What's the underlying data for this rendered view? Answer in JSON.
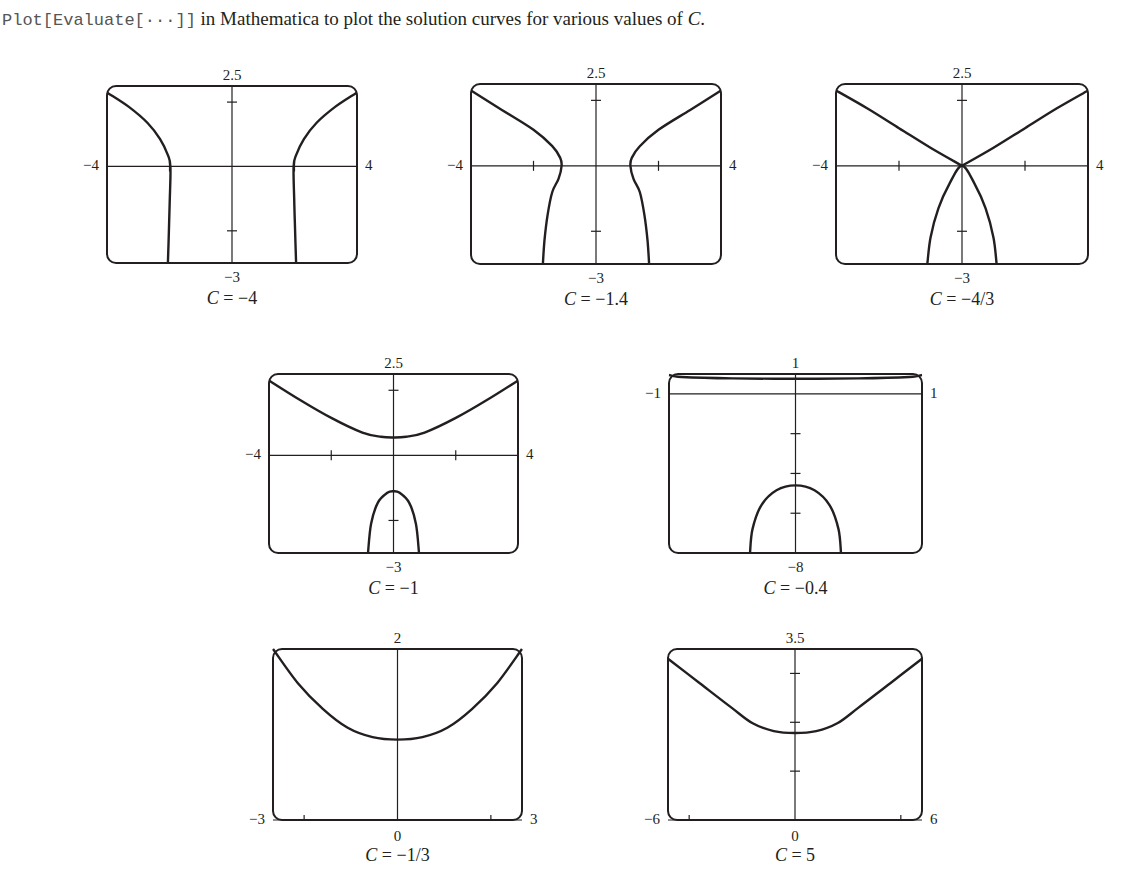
{
  "intro": {
    "code": "Plot[Evaluate[···]]",
    "text_before_c": " in Mathematica to plot the solution curves for various values of ",
    "c_symbol": "C",
    "text_after_c": "."
  },
  "chart_data": [
    {
      "type": "line",
      "title": "C = −4",
      "caption_var": "C",
      "caption_value": "= −4",
      "frame": {
        "left": 107,
        "top": 86,
        "width": 250,
        "height": 177
      },
      "xlim": [
        -4,
        4
      ],
      "ylim": [
        -3,
        2.5
      ],
      "axis_y_at": 0,
      "labels": {
        "top": "2.5",
        "bottom": "−3",
        "left": "−4",
        "right": "4"
      },
      "xticks": [
        -2,
        2
      ],
      "yticks": [
        -2,
        2
      ],
      "grid": false,
      "series": [
        {
          "name": "left-branch",
          "points": [
            [
              -4,
              2.3
            ],
            [
              -3.3,
              1.85
            ],
            [
              -2.7,
              1.35
            ],
            [
              -2.3,
              0.85
            ],
            [
              -2.05,
              0.35
            ],
            [
              -1.97,
              0
            ],
            [
              -1.99,
              -1
            ],
            [
              -2.02,
              -2
            ],
            [
              -2.05,
              -3
            ]
          ]
        },
        {
          "name": "right-branch",
          "points": [
            [
              4,
              2.3
            ],
            [
              3.3,
              1.85
            ],
            [
              2.7,
              1.35
            ],
            [
              2.3,
              0.85
            ],
            [
              2.05,
              0.35
            ],
            [
              1.97,
              0
            ],
            [
              1.99,
              -1
            ],
            [
              2.02,
              -2
            ],
            [
              2.05,
              -3
            ]
          ]
        }
      ]
    },
    {
      "type": "line",
      "title": "C = −1.4",
      "caption_var": "C",
      "caption_value": "= −1.4",
      "frame": {
        "left": 471,
        "top": 84,
        "width": 250,
        "height": 180
      },
      "xlim": [
        -4,
        4
      ],
      "ylim": [
        -3,
        2.5
      ],
      "axis_y_at": 0,
      "labels": {
        "top": "2.5",
        "bottom": "−3",
        "left": "−4",
        "right": "4"
      },
      "xticks": [
        -2,
        2
      ],
      "yticks": [
        -2,
        2
      ],
      "grid": false,
      "series": [
        {
          "name": "left-branch",
          "points": [
            [
              -4,
              2.3
            ],
            [
              -3,
              1.7
            ],
            [
              -2,
              1.1
            ],
            [
              -1.4,
              0.6
            ],
            [
              -1.15,
              0.25
            ],
            [
              -1.1,
              0
            ],
            [
              -1.2,
              -0.4
            ],
            [
              -1.4,
              -0.8
            ],
            [
              -1.55,
              -1.5
            ],
            [
              -1.65,
              -2.3
            ],
            [
              -1.7,
              -3
            ]
          ]
        },
        {
          "name": "right-branch",
          "points": [
            [
              4,
              2.3
            ],
            [
              3,
              1.7
            ],
            [
              2,
              1.1
            ],
            [
              1.4,
              0.6
            ],
            [
              1.15,
              0.25
            ],
            [
              1.1,
              0
            ],
            [
              1.2,
              -0.4
            ],
            [
              1.4,
              -0.8
            ],
            [
              1.55,
              -1.5
            ],
            [
              1.65,
              -2.3
            ],
            [
              1.7,
              -3
            ]
          ]
        }
      ]
    },
    {
      "type": "line",
      "title": "C = −4/3",
      "caption_var": "C",
      "caption_value": "= −4/3",
      "frame": {
        "left": 836,
        "top": 84,
        "width": 252,
        "height": 180
      },
      "xlim": [
        -4,
        4
      ],
      "ylim": [
        -3,
        2.5
      ],
      "axis_y_at": 0,
      "labels": {
        "top": "2.5",
        "bottom": "−3",
        "left": "−4",
        "right": "4"
      },
      "xticks": [
        -2,
        2
      ],
      "yticks": [
        -2,
        2
      ],
      "grid": false,
      "series": [
        {
          "name": "upper-left",
          "points": [
            [
              -4,
              2.3
            ],
            [
              -3,
              1.75
            ],
            [
              -2,
              1.15
            ],
            [
              -1,
              0.55
            ],
            [
              0,
              0
            ]
          ]
        },
        {
          "name": "upper-right",
          "points": [
            [
              0,
              0
            ],
            [
              1,
              0.55
            ],
            [
              2,
              1.15
            ],
            [
              3,
              1.75
            ],
            [
              4,
              2.3
            ]
          ]
        },
        {
          "name": "lower-cap",
          "points": [
            [
              -1.1,
              -3
            ],
            [
              -1.0,
              -2.2
            ],
            [
              -0.75,
              -1.3
            ],
            [
              -0.4,
              -0.55
            ],
            [
              0,
              0
            ],
            [
              0.4,
              -0.55
            ],
            [
              0.75,
              -1.3
            ],
            [
              1.0,
              -2.2
            ],
            [
              1.1,
              -3
            ]
          ]
        }
      ]
    },
    {
      "type": "line",
      "title": "C = −1",
      "caption_var": "C",
      "caption_value": "= −1",
      "frame": {
        "left": 269,
        "top": 374,
        "width": 249,
        "height": 179
      },
      "xlim": [
        -4,
        4
      ],
      "ylim": [
        -3,
        2.5
      ],
      "axis_y_at": 0,
      "labels": {
        "top": "2.5",
        "bottom": "−3",
        "left": "−4",
        "right": "4"
      },
      "xticks": [
        -2,
        2
      ],
      "yticks": [
        -2,
        2
      ],
      "grid": false,
      "series": [
        {
          "name": "upper-curve",
          "points": [
            [
              -4,
              2.3
            ],
            [
              -3,
              1.7
            ],
            [
              -2,
              1.15
            ],
            [
              -1,
              0.7
            ],
            [
              -0.4,
              0.57
            ],
            [
              0,
              0.55
            ],
            [
              0.4,
              0.57
            ],
            [
              1,
              0.7
            ],
            [
              2,
              1.15
            ],
            [
              3,
              1.7
            ],
            [
              4,
              2.3
            ]
          ]
        },
        {
          "name": "lower-cap",
          "points": [
            [
              -0.82,
              -3
            ],
            [
              -0.72,
              -2.1
            ],
            [
              -0.5,
              -1.45
            ],
            [
              -0.2,
              -1.15
            ],
            [
              0,
              -1.1
            ],
            [
              0.2,
              -1.15
            ],
            [
              0.5,
              -1.45
            ],
            [
              0.72,
              -2.1
            ],
            [
              0.82,
              -3
            ]
          ]
        }
      ]
    },
    {
      "type": "line",
      "title": "C = −0.4",
      "caption_var": "C",
      "caption_value": "= −0.4",
      "frame": {
        "left": 669,
        "top": 374,
        "width": 253,
        "height": 179
      },
      "xlim": [
        -1,
        1
      ],
      "ylim": [
        -8,
        1
      ],
      "axis_y_at": 0,
      "labels": {
        "top": "1",
        "bottom": "−8",
        "left": "−1",
        "right": "1"
      },
      "xticks": [],
      "yticks": [
        -2,
        -4,
        -6
      ],
      "grid": false,
      "series": [
        {
          "name": "upper-curve",
          "points": [
            [
              -1,
              0.95
            ],
            [
              -0.9,
              0.85
            ],
            [
              -0.5,
              0.78
            ],
            [
              0,
              0.76
            ],
            [
              0.5,
              0.78
            ],
            [
              0.9,
              0.85
            ],
            [
              1,
              0.95
            ]
          ]
        },
        {
          "name": "lower-cap",
          "points": [
            [
              -0.36,
              -8
            ],
            [
              -0.34,
              -6.8
            ],
            [
              -0.27,
              -5.6
            ],
            [
              -0.15,
              -4.85
            ],
            [
              0,
              -4.6
            ],
            [
              0.15,
              -4.85
            ],
            [
              0.27,
              -5.6
            ],
            [
              0.34,
              -6.8
            ],
            [
              0.36,
              -8
            ]
          ]
        }
      ]
    },
    {
      "type": "line",
      "title": "C = −1/3",
      "caption_var": "C",
      "caption_value": "= −1/3",
      "frame": {
        "left": 273,
        "top": 649,
        "width": 249,
        "height": 171
      },
      "xlim": [
        -3,
        3
      ],
      "ylim": [
        0,
        2
      ],
      "axis_y_at": 0,
      "labels": {
        "top": "2",
        "bottom": "0",
        "left": "−3",
        "right": "3"
      },
      "xticks": [
        -2.25,
        2.25
      ],
      "yticks": [],
      "grid": false,
      "series": [
        {
          "name": "curve",
          "points": [
            [
              -3,
              2
            ],
            [
              -2.4,
              1.6
            ],
            [
              -1.8,
              1.3
            ],
            [
              -1.2,
              1.08
            ],
            [
              -0.6,
              0.97
            ],
            [
              0,
              0.94
            ],
            [
              0.6,
              0.97
            ],
            [
              1.2,
              1.08
            ],
            [
              1.8,
              1.3
            ],
            [
              2.4,
              1.6
            ],
            [
              3,
              2
            ]
          ]
        }
      ]
    },
    {
      "type": "line",
      "title": "C = 5",
      "caption_var": "C",
      "caption_value": "= 5",
      "frame": {
        "left": 668,
        "top": 649,
        "width": 254,
        "height": 171
      },
      "xlim": [
        -6,
        6
      ],
      "ylim": [
        0,
        3.5
      ],
      "axis_y_at": 0,
      "labels": {
        "top": "3.5",
        "bottom": "0",
        "left": "−6",
        "right": "6"
      },
      "xticks": [
        -5,
        5
      ],
      "yticks": [
        1,
        2,
        3
      ],
      "grid": false,
      "series": [
        {
          "name": "curve",
          "points": [
            [
              -6,
              3.3
            ],
            [
              -4.5,
              2.8
            ],
            [
              -3,
              2.3
            ],
            [
              -2,
              1.98
            ],
            [
              -1,
              1.82
            ],
            [
              0,
              1.78
            ],
            [
              1,
              1.82
            ],
            [
              2,
              1.98
            ],
            [
              3,
              2.3
            ],
            [
              4.5,
              2.8
            ],
            [
              6,
              3.3
            ]
          ]
        }
      ]
    }
  ]
}
